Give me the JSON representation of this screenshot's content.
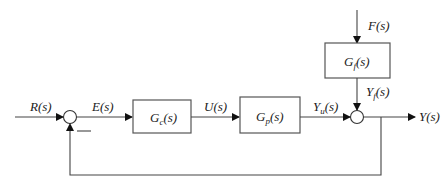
{
  "diagram": {
    "type": "feedback-control-block-diagram",
    "signals": {
      "input": "R(s)",
      "error": "E(s)",
      "control": "U(s)",
      "plant_output": {
        "main": "Y",
        "sub": "u",
        "tail": "(s)"
      },
      "disturbance": "F(s)",
      "disturbance_output": {
        "main": "Y",
        "sub": "f",
        "tail": "(s)"
      },
      "output": "Y(s)"
    },
    "blocks": [
      {
        "id": "controller",
        "main": "G",
        "sub": "c",
        "tail": "(s)"
      },
      {
        "id": "plant",
        "main": "G",
        "sub": "p",
        "tail": "(s)"
      },
      {
        "id": "disturbance",
        "main": "G",
        "sub": "f",
        "tail": "(s)"
      }
    ],
    "summing_junctions": [
      {
        "id": "error-junction",
        "feedback_sign": "—"
      },
      {
        "id": "output-junction"
      }
    ]
  }
}
